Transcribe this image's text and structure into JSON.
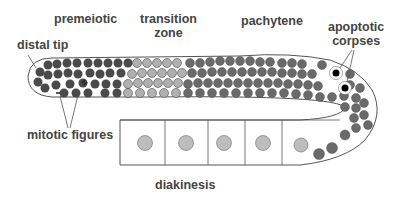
{
  "labels": {
    "premeiotic": "premeiotic",
    "transition_zone_1": "transition",
    "transition_zone_2": "zone",
    "pachytene": "pachytene",
    "apoptotic_1": "apoptotic",
    "apoptotic_2": "corpses",
    "distal_tip": "distal tip",
    "mitotic_figures": "mitotic figures",
    "diakinesis": "diakinesis"
  },
  "colors": {
    "outline": "#555555",
    "nucleus_dark": "#4a4a4a",
    "nucleus_pachytene": "#6a6a6a",
    "nucleus_light": "#b0b0b0",
    "oocyte_nucleus": "#bdbdbd",
    "text": "#444444"
  }
}
